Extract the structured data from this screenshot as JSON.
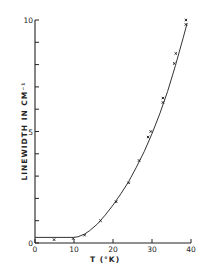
{
  "chart_data": {
    "type": "scatter",
    "title": "",
    "xlabel": "T (°K)",
    "ylabel": "LINEWIDTH IN CM⁻¹",
    "xlim": [
      0,
      40
    ],
    "ylim": [
      0,
      10
    ],
    "x_ticks": [
      0,
      10,
      20,
      30,
      40
    ],
    "x_tick_labels": [
      "0",
      "10",
      "20",
      "30",
      "40"
    ],
    "y_ticks": [
      0,
      1,
      2,
      3,
      4,
      5,
      6,
      7,
      8,
      9,
      10
    ],
    "y_tick_labels": [
      "0",
      "",
      "",
      "",
      "",
      "5",
      "",
      "",
      "",
      "",
      "10"
    ],
    "grid": false,
    "legend": null,
    "series": [
      {
        "name": "measured",
        "style": "points",
        "x": [
          4.9,
          9.8,
          12.7,
          16.8,
          20.8,
          24.0,
          26.7,
          29.0,
          29.7,
          32.8,
          32.8,
          35.7,
          36.1,
          38.7,
          38.7
        ],
        "y": [
          0.15,
          0.2,
          0.35,
          1.0,
          1.85,
          2.7,
          3.7,
          4.75,
          5.0,
          6.5,
          6.3,
          8.05,
          8.5,
          9.8,
          10.0
        ]
      },
      {
        "name": "fit",
        "style": "line",
        "x": [
          0,
          9.8,
          11,
          12.7,
          14,
          16,
          18,
          20,
          22,
          24,
          26,
          28,
          30,
          32,
          34,
          36,
          38,
          39
        ],
        "y": [
          0.25,
          0.25,
          0.28,
          0.4,
          0.55,
          0.85,
          1.25,
          1.7,
          2.2,
          2.75,
          3.4,
          4.1,
          4.9,
          5.8,
          6.8,
          7.95,
          9.2,
          9.85
        ]
      }
    ]
  }
}
